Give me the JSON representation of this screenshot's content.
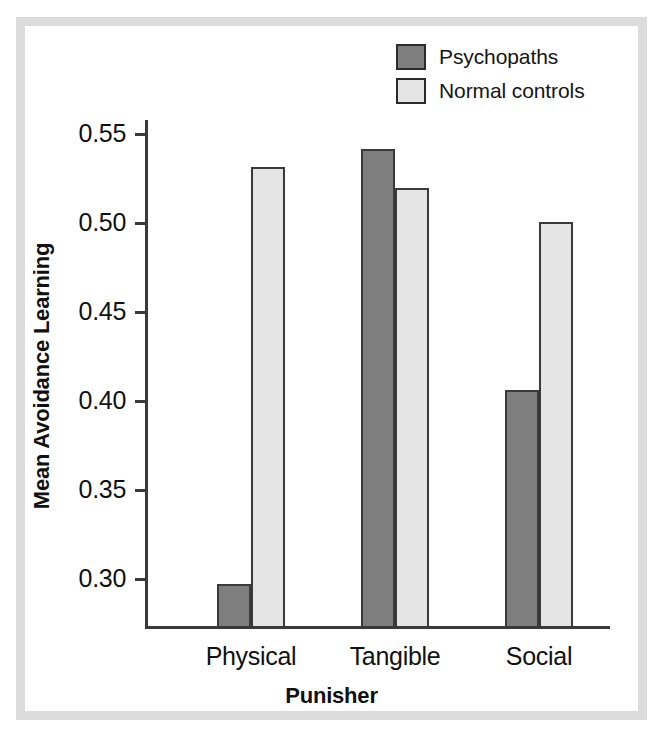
{
  "figure": {
    "frame_color": "#dcdcdc",
    "background_color": "#ffffff"
  },
  "legend": {
    "position": "top-right",
    "entries": [
      {
        "label": "Psychopaths",
        "color": "#7e7e7e"
      },
      {
        "label": "Normal controls",
        "color": "#e4e4e4"
      }
    ]
  },
  "chart_data": {
    "type": "bar",
    "title": "",
    "subtitle": "",
    "xlabel": "Punisher",
    "ylabel": "Mean Avoidance Learning",
    "categories": [
      "Physical",
      "Tangible",
      "Social"
    ],
    "series": [
      {
        "name": "Psychopaths",
        "color": "#7e7e7e",
        "values": [
          0.297,
          0.541,
          0.406
        ]
      },
      {
        "name": "Normal controls",
        "color": "#e4e4e4",
        "values": [
          0.531,
          0.519,
          0.5
        ]
      }
    ],
    "ylim": [
      0.272,
      0.558
    ],
    "yticks": [
      0.3,
      0.35,
      0.4,
      0.45,
      0.5,
      0.55
    ],
    "ytick_labels": [
      "0.30",
      "0.35",
      "0.40",
      "0.45",
      "0.50",
      "0.55"
    ],
    "grid": false,
    "legend_position": "top-right",
    "bar_edge_color": "#3a3a3a",
    "axis_color": "#3a3a3a"
  }
}
